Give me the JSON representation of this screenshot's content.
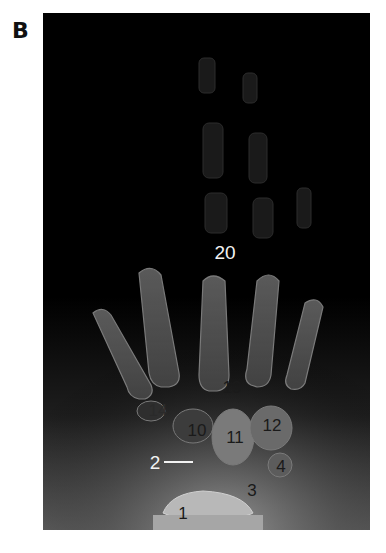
{
  "panel": {
    "letter": "B"
  },
  "image": {
    "type": "hand X-ray radiograph",
    "background_color": "#000000",
    "bone_color": "#8a8a8a"
  },
  "labels": [
    {
      "id": "20",
      "text": "20",
      "x": 182,
      "y": 239,
      "tone": "light"
    },
    {
      "id": "19",
      "text": "19",
      "x": 189,
      "y": 374,
      "tone": "dark"
    },
    {
      "id": "14",
      "text": "14",
      "x": 115,
      "y": 397,
      "tone": "dark"
    },
    {
      "id": "10",
      "text": "10",
      "x": 154,
      "y": 417,
      "tone": "dark"
    },
    {
      "id": "11",
      "text": "11",
      "x": 192,
      "y": 424,
      "tone": "dark"
    },
    {
      "id": "12",
      "text": "12",
      "x": 229,
      "y": 412,
      "tone": "dark"
    },
    {
      "id": "2",
      "text": "2",
      "x": 109,
      "y": 449,
      "tone": "light",
      "pointer": true
    },
    {
      "id": "4",
      "text": "4",
      "x": 238,
      "y": 453,
      "tone": "dark"
    },
    {
      "id": "3",
      "text": "3",
      "x": 209,
      "y": 477,
      "tone": "dark"
    },
    {
      "id": "1",
      "text": "1",
      "x": 140,
      "y": 500,
      "tone": "dark"
    }
  ]
}
